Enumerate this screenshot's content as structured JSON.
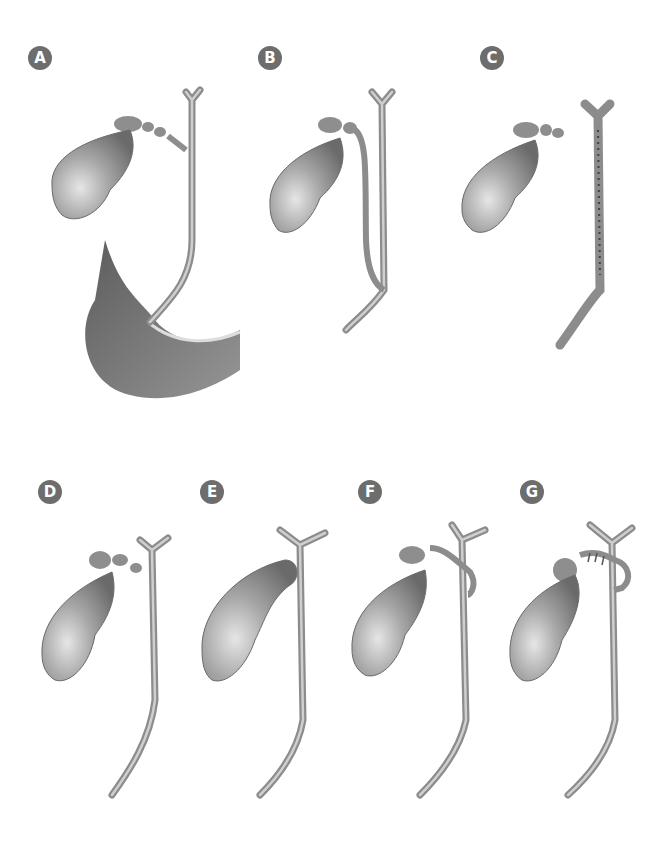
{
  "diagram": {
    "background": "#ffffff",
    "badge_color": "#6d6d6d",
    "organ_color": "#9a9a9a",
    "panels": [
      {
        "label": "A",
        "variant": "normal-with-duodenum",
        "x": 28,
        "y": 46
      },
      {
        "label": "B",
        "variant": "long-parallel-cystic-duct",
        "x": 258,
        "y": 46
      },
      {
        "label": "C",
        "variant": "parallel-fused-cystic-duct",
        "x": 480,
        "y": 46
      },
      {
        "label": "D",
        "variant": "short-cystic-duct-low-insertion",
        "x": 38,
        "y": 480
      },
      {
        "label": "E",
        "variant": "absent-cystic-duct",
        "x": 200,
        "y": 480
      },
      {
        "label": "F",
        "variant": "posterior-spiral-cystic-duct",
        "x": 358,
        "y": 480
      },
      {
        "label": "G",
        "variant": "anterior-spiral-cystic-duct",
        "x": 520,
        "y": 480
      }
    ]
  }
}
